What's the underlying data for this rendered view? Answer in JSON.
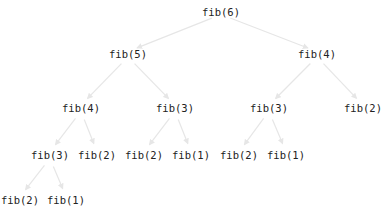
{
  "diagram": {
    "edge_color": "#e6e6e6",
    "text_color": "#222222",
    "nodes": [
      {
        "id": "n0",
        "label": "fib(6)",
        "x": 221,
        "y": 12
      },
      {
        "id": "n1",
        "label": "fib(5)",
        "x": 128,
        "y": 54
      },
      {
        "id": "n2",
        "label": "fib(4)",
        "x": 317,
        "y": 54
      },
      {
        "id": "n3",
        "label": "fib(4)",
        "x": 81,
        "y": 108
      },
      {
        "id": "n4",
        "label": "fib(3)",
        "x": 175,
        "y": 108
      },
      {
        "id": "n5",
        "label": "fib(3)",
        "x": 269,
        "y": 108
      },
      {
        "id": "n6",
        "label": "fib(2)",
        "x": 363,
        "y": 108
      },
      {
        "id": "n7",
        "label": "fib(3)",
        "x": 50,
        "y": 155
      },
      {
        "id": "n8",
        "label": "fib(2)",
        "x": 97,
        "y": 155
      },
      {
        "id": "n9",
        "label": "fib(2)",
        "x": 144,
        "y": 155
      },
      {
        "id": "n10",
        "label": "fib(1)",
        "x": 191,
        "y": 155
      },
      {
        "id": "n11",
        "label": "fib(2)",
        "x": 239,
        "y": 155
      },
      {
        "id": "n12",
        "label": "fib(1)",
        "x": 286,
        "y": 155
      },
      {
        "id": "n13",
        "label": "fib(2)",
        "x": 20,
        "y": 200
      },
      {
        "id": "n14",
        "label": "fib(1)",
        "x": 66,
        "y": 200
      }
    ],
    "edges": [
      {
        "from": "n0",
        "to": "n1"
      },
      {
        "from": "n0",
        "to": "n2"
      },
      {
        "from": "n1",
        "to": "n3"
      },
      {
        "from": "n1",
        "to": "n4"
      },
      {
        "from": "n2",
        "to": "n5"
      },
      {
        "from": "n2",
        "to": "n6"
      },
      {
        "from": "n3",
        "to": "n7"
      },
      {
        "from": "n3",
        "to": "n8"
      },
      {
        "from": "n4",
        "to": "n9"
      },
      {
        "from": "n4",
        "to": "n10"
      },
      {
        "from": "n5",
        "to": "n11"
      },
      {
        "from": "n5",
        "to": "n12"
      },
      {
        "from": "n7",
        "to": "n13"
      },
      {
        "from": "n7",
        "to": "n14"
      }
    ]
  }
}
